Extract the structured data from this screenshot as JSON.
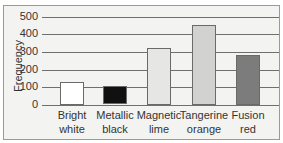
{
  "chart_data": {
    "type": "bar",
    "title": "",
    "xlabel": "",
    "ylabel": "Frequency",
    "ylim": [
      0,
      500
    ],
    "yticks": [
      0,
      100,
      200,
      300,
      400,
      500
    ],
    "grid": true,
    "legend": null,
    "categories": [
      "Bright white",
      "Metallic black",
      "Magnetic lime",
      "Tangerine orange",
      "Fusion red"
    ],
    "category_lines": [
      [
        "Bright",
        "white"
      ],
      [
        "Metallic",
        "black"
      ],
      [
        "Magnetic",
        "lime"
      ],
      [
        "Tangerine",
        "orange"
      ],
      [
        "Fusion",
        "red"
      ]
    ],
    "values": [
      130,
      105,
      325,
      455,
      285
    ],
    "colors": [
      "#ffffff",
      "#111111",
      "#e6e6e4",
      "#d2d2d0",
      "#7c7c7c"
    ]
  },
  "axis": {
    "ylabel": "Frequency",
    "ticks": [
      "0",
      "100",
      "200",
      "300",
      "400",
      "500"
    ]
  }
}
